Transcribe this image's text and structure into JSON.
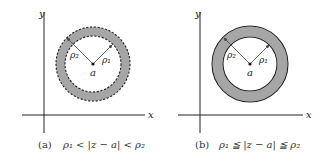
{
  "panels": [
    {
      "id": "a",
      "axis_x_label": "x",
      "axis_y_label": "y",
      "center_label": "a",
      "rho1_label": "ρ₁",
      "rho2_label": "ρ₂",
      "boundary": "dashed",
      "caption_tag": "(a)",
      "caption_formula": "ρ₁ < |z − a| < ρ₂"
    },
    {
      "id": "b",
      "axis_x_label": "x",
      "axis_y_label": "y",
      "center_label": "a",
      "rho1_label": "ρ₁",
      "rho2_label": "ρ₂",
      "boundary": "solid",
      "caption_tag": "(b)",
      "caption_formula": "ρ₁ ≦ |z − a| ≦ ρ₂"
    }
  ],
  "colors": {
    "annulus_fill": "#a6a6a6",
    "line": "#222222"
  }
}
